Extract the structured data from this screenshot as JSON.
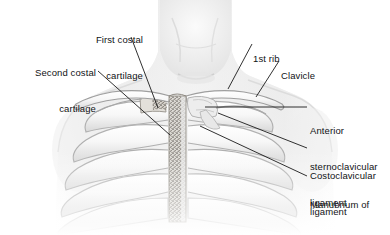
{
  "figure": {
    "view": "anterior chest wall with rib cage, clavicles and sternum",
    "style": "grayscale medical illustration",
    "background_color": "#ffffff",
    "text_color": "#111315",
    "leader_color": "#1a1a1a"
  },
  "labels": {
    "first_costal_cartilage": {
      "line1": "First costal",
      "line2": "cartilage",
      "align": "right",
      "x": 143,
      "y": 10,
      "leader": {
        "x1": 131,
        "y1": 37,
        "x2": 158,
        "y2": 108
      }
    },
    "second_costal_cartilage": {
      "line1": "Second costal",
      "line2": "cartilage",
      "align": "right",
      "x": 96,
      "y": 43,
      "leader": {
        "x1": 98,
        "y1": 71,
        "x2": 170,
        "y2": 135
      }
    },
    "first_rib": {
      "line1": "1st rib",
      "align": "left",
      "x": 253,
      "y": 29,
      "leader": {
        "x1": 252,
        "y1": 44,
        "x2": 228,
        "y2": 89
      }
    },
    "clavicle": {
      "line1": "Clavicle",
      "align": "left",
      "x": 281,
      "y": 46,
      "leader": {
        "x1": 279,
        "y1": 61,
        "x2": 256,
        "y2": 97
      }
    },
    "anterior_sternoclavicular_ligament": {
      "line1": "Anterior",
      "line2": "sternoclavicular",
      "line3": "ligament",
      "align": "left",
      "x": 310,
      "y": 101,
      "leader": {
        "x1": 307,
        "y1": 107,
        "x2": 205,
        "y2": 107
      }
    },
    "costoclavicular_ligament": {
      "line1": "Costoclavicular",
      "line2": "ligament",
      "align": "left",
      "x": 310,
      "y": 146,
      "leader": {
        "x1": 307,
        "y1": 148,
        "x2": 218,
        "y2": 113
      }
    },
    "manubrium_of_the_sternum": {
      "line1": "Manubrium of",
      "line2": "the sternum",
      "align": "left",
      "x": 310,
      "y": 175,
      "leader": {
        "x1": 307,
        "y1": 176,
        "x2": 200,
        "y2": 126
      }
    }
  },
  "anatomy": {
    "sternum": {
      "name": "manubrium and body of sternum",
      "x": 170,
      "width": 16,
      "y_top": 96,
      "y_bottom": 220
    },
    "ribs_left_count": 6,
    "ribs_right_count": 6,
    "clavicle_left": "left clavicle",
    "clavicle_right": "right clavicle"
  }
}
